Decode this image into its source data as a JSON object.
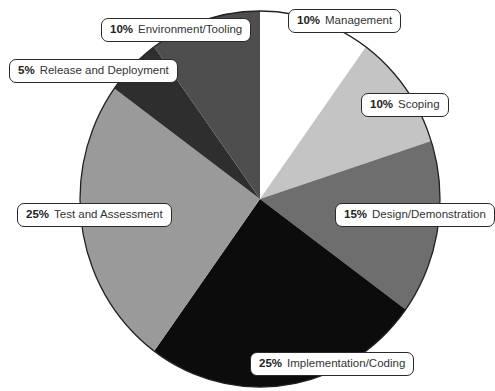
{
  "chart_data": {
    "type": "pie",
    "title": "",
    "start_angle_deg": 0,
    "direction": "clockwise",
    "slices": [
      {
        "label": "Management",
        "value": 10,
        "pct_label": "10%",
        "color": "#ffffff"
      },
      {
        "label": "Scoping",
        "value": 10,
        "pct_label": "10%",
        "color": "#c4c4c4"
      },
      {
        "label": "Design/Demonstration",
        "value": 15,
        "pct_label": "15%",
        "color": "#6e6e6e"
      },
      {
        "label": "Implementation/Coding",
        "value": 25,
        "pct_label": "25%",
        "color": "#0c0c0c"
      },
      {
        "label": "Test and Assessment",
        "value": 25,
        "pct_label": "25%",
        "color": "#9a9a9a"
      },
      {
        "label": "Release and Deployment",
        "value": 5,
        "pct_label": "5%",
        "color": "#2e2e2e"
      },
      {
        "label": "Environment/Tooling",
        "value": 10,
        "pct_label": "10%",
        "color": "#4e4e4e"
      }
    ],
    "legend": "callout labels"
  },
  "geometry": {
    "cx": 260,
    "cy": 199,
    "rx": 180,
    "ry": 188
  },
  "labels": [
    {
      "pct": "10%",
      "text": "Management",
      "x": 288,
      "y": 9
    },
    {
      "pct": "10%",
      "text": "Scoping",
      "x": 361,
      "y": 93
    },
    {
      "pct": "15%",
      "text": "Design/Demonstration",
      "x": 335,
      "y": 203
    },
    {
      "pct": "25%",
      "text": "Implementation/Coding",
      "x": 250,
      "y": 352
    },
    {
      "pct": "25%",
      "text": "Test and Assessment",
      "x": 17,
      "y": 203
    },
    {
      "pct": "5%",
      "text": "Release and Deployment",
      "x": 9,
      "y": 59
    },
    {
      "pct": "10%",
      "text": "Environment/Tooling",
      "x": 101,
      "y": 18
    }
  ]
}
